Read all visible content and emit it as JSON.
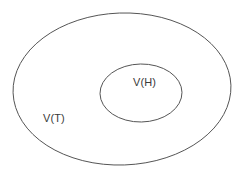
{
  "diagram": {
    "type": "nested-set-diagram",
    "background_color": "#ffffff",
    "stroke_color": "#555555",
    "label_color": "#3a3a3a",
    "sets": [
      {
        "id": "outer",
        "label": "V(T)",
        "shape": "ellipse",
        "center_x": 122,
        "center_y": 89,
        "radius_x": 109,
        "radius_y": 76,
        "rotation_deg": -2,
        "label_x": 43,
        "label_y": 112
      },
      {
        "id": "inner",
        "label": "V(H)",
        "shape": "ellipse",
        "center_x": 141,
        "center_y": 93,
        "radius_x": 41,
        "radius_y": 29,
        "rotation_deg": -1,
        "label_x": 133,
        "label_y": 76
      }
    ]
  }
}
